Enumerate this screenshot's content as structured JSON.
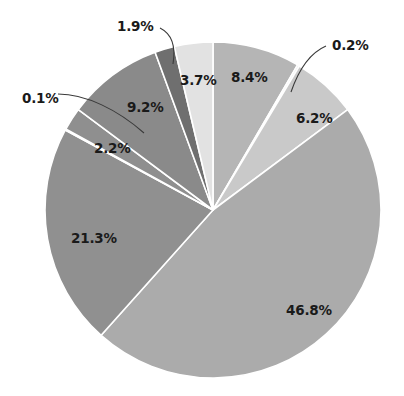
{
  "chart_data": {
    "type": "pie",
    "title": "",
    "xlabel": "",
    "ylabel": "",
    "legend": "none",
    "grid": false,
    "units": "percent",
    "start_angle_deg": 90,
    "direction": "clockwise",
    "total": 100.0,
    "categories": [
      "Slice 1",
      "Slice 2",
      "Slice 3",
      "Slice 4",
      "Slice 5",
      "Slice 6",
      "Slice 7",
      "Slice 8",
      "Slice 9",
      "Slice 10"
    ],
    "values": [
      8.4,
      0.2,
      6.2,
      46.8,
      21.3,
      0.1,
      2.2,
      9.2,
      1.9,
      3.7
    ],
    "labels": [
      "8.4%",
      "0.2%",
      "6.2%",
      "46.8%",
      "21.3%",
      "0.1%",
      "2.2%",
      "9.2%",
      "1.9%",
      "3.7%"
    ],
    "colors": [
      "#b5b5b5",
      "#e8e8e8",
      "#c9c9c9",
      "#ababab",
      "#909090",
      "#f0f0f0",
      "#8f8f8f",
      "#8a8a8a",
      "#6f6f6f",
      "#e2e2e2"
    ],
    "slices": [
      {
        "label": "8.4%",
        "value": 8.4,
        "color": "#b5b5b5",
        "callout": false,
        "label_x": 231,
        "label_y": 71
      },
      {
        "label": "0.2%",
        "value": 0.2,
        "color": "#e8e8e8",
        "callout": true,
        "label_x": 332,
        "label_y": 39
      },
      {
        "label": "6.2%",
        "value": 6.2,
        "color": "#c9c9c9",
        "callout": false,
        "label_x": 296,
        "label_y": 112
      },
      {
        "label": "46.8%",
        "value": 46.8,
        "color": "#ababab",
        "callout": false,
        "label_x": 286,
        "label_y": 304
      },
      {
        "label": "21.3%",
        "value": 21.3,
        "color": "#909090",
        "callout": false,
        "label_x": 71,
        "label_y": 232
      },
      {
        "label": "0.1%",
        "value": 0.1,
        "color": "#f0f0f0",
        "callout": true,
        "label_x": 22,
        "label_y": 92
      },
      {
        "label": "2.2%",
        "value": 2.2,
        "color": "#8f8f8f",
        "callout": false,
        "label_x": 94,
        "label_y": 142
      },
      {
        "label": "9.2%",
        "value": 9.2,
        "color": "#8a8a8a",
        "callout": false,
        "label_x": 127,
        "label_y": 101
      },
      {
        "label": "1.9%",
        "value": 1.9,
        "color": "#6f6f6f",
        "callout": true,
        "label_x": 117,
        "label_y": 20
      },
      {
        "label": "3.7%",
        "value": 3.7,
        "color": "#e2e2e2",
        "callout": false,
        "label_x": 180,
        "label_y": 74
      }
    ],
    "geometry": {
      "center_x": 213,
      "center_y": 210,
      "radius": 168,
      "background": "#ffffff"
    }
  }
}
